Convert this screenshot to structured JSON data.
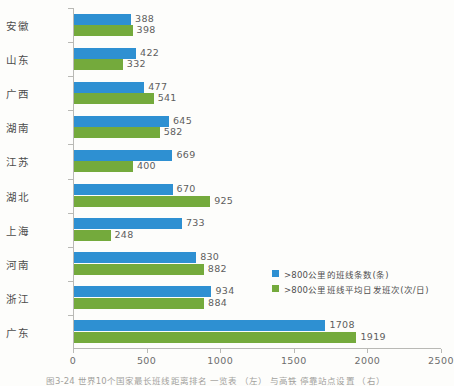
{
  "chart_data": {
    "type": "bar",
    "orientation": "horizontal",
    "title": "",
    "subtitle": "",
    "xlabel": "",
    "ylabel": "",
    "xlim": [
      0,
      2500
    ],
    "grid": false,
    "legend_position": "bottom-right",
    "categories": [
      "安徽",
      "山东",
      "广西",
      "湖南",
      "江苏",
      "湖北",
      "上海",
      "河南",
      "浙江",
      "广东"
    ],
    "xticks": [
      0,
      500,
      1000,
      1500,
      2000,
      2500
    ],
    "xtick_labels": [
      "0",
      "500",
      "1000",
      "1500",
      "2000",
      "2500"
    ],
    "series": [
      {
        "name": ">800公里的班线条数(条)",
        "color": "#2e90d2",
        "values": [
          388,
          422,
          477,
          645,
          669,
          670,
          733,
          830,
          934,
          1708
        ]
      },
      {
        "name": ">800公里班线平均日发班次(次/日)",
        "color": "#74aa3c",
        "values": [
          398,
          332,
          541,
          582,
          400,
          925,
          248,
          882,
          884,
          1919
        ]
      }
    ]
  },
  "legend": {
    "items": [
      {
        "label": ">800公里的班线条数(条)",
        "color": "#2e90d2"
      },
      {
        "label": ">800公里班线平均日发班次(次/日)",
        "color": "#74aa3c"
      }
    ]
  },
  "caption": {
    "text": "图3-24 世界10个国家最长班线距离排名 一览表 （左） 与高铁 停靠站点设置 （右）"
  },
  "colors": {
    "series_blue": "#2e90d2",
    "series_green": "#74aa3c",
    "axis": "#b9b9b5",
    "text": "#4c4c4c",
    "background": "#fdfdfb"
  }
}
